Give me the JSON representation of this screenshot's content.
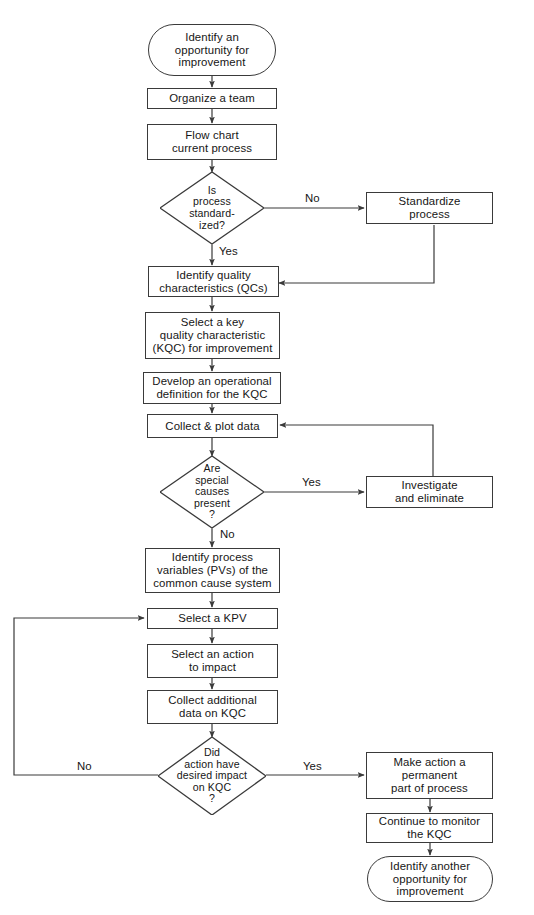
{
  "diagram": {
    "type": "flowchart",
    "background_color": "#ffffff",
    "line_color": "#3a3a3a",
    "text_color": "#161616"
  },
  "nodes": {
    "start": {
      "shape": "terminal",
      "lines": [
        "Identify an",
        "opportunity for",
        "improvement"
      ]
    },
    "organize_team": {
      "shape": "process",
      "lines": [
        "Organize a team"
      ]
    },
    "flow_chart_process": {
      "shape": "process",
      "lines": [
        "Flow chart",
        "current process"
      ]
    },
    "is_standardized": {
      "shape": "decision",
      "lines": [
        "Is",
        "process",
        "standard-",
        "ized?"
      ]
    },
    "standardize_process": {
      "shape": "process",
      "lines": [
        "Standardize",
        "process"
      ]
    },
    "identify_qcs": {
      "shape": "process",
      "lines": [
        "Identify quality",
        "characteristics (QCs)"
      ]
    },
    "select_kqc": {
      "shape": "process",
      "lines": [
        "Select a key",
        "quality characteristic",
        "(KQC) for improvement"
      ]
    },
    "operational_definition": {
      "shape": "process",
      "lines": [
        "Develop an operational",
        "definition for the KQC"
      ]
    },
    "collect_plot_data": {
      "shape": "process",
      "lines": [
        "Collect & plot data"
      ]
    },
    "special_causes": {
      "shape": "decision",
      "lines": [
        "Are",
        "special",
        "causes",
        "present",
        "?"
      ]
    },
    "investigate_eliminate": {
      "shape": "process",
      "lines": [
        "Investigate",
        "and eliminate"
      ]
    },
    "identify_pvs": {
      "shape": "process",
      "lines": [
        "Identify process",
        "variables (PVs) of the",
        "common cause system"
      ]
    },
    "select_kpv": {
      "shape": "process",
      "lines": [
        "Select a KPV"
      ]
    },
    "select_action": {
      "shape": "process",
      "lines": [
        "Select an action",
        "to impact"
      ]
    },
    "collect_additional": {
      "shape": "process",
      "lines": [
        "Collect additional",
        "data on KQC"
      ]
    },
    "desired_impact": {
      "shape": "decision",
      "lines": [
        "Did",
        "action have",
        "desired impact",
        "on KQC",
        "?"
      ]
    },
    "make_permanent": {
      "shape": "process",
      "lines": [
        "Make action a",
        "permanent",
        "part of process"
      ]
    },
    "continue_monitor": {
      "shape": "process",
      "lines": [
        "Continue to monitor",
        "the KQC"
      ]
    },
    "end": {
      "shape": "terminal",
      "lines": [
        "Identify another",
        "opportunity for",
        "improvement"
      ]
    }
  },
  "edge_labels": {
    "standardized_no": "No",
    "standardized_yes": "Yes",
    "special_causes_yes": "Yes",
    "special_causes_no": "No",
    "desired_impact_yes": "Yes",
    "desired_impact_no": "No"
  }
}
